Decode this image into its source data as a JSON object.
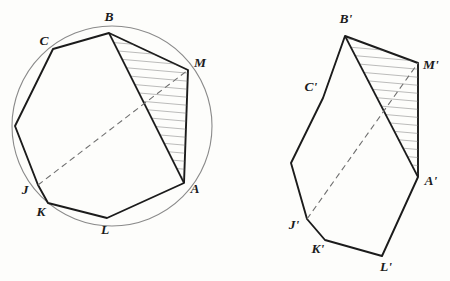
{
  "figure": {
    "kind": "geometry-diagram",
    "background_color": "#fdfdfb",
    "stroke_color": "#1b1b1b",
    "circle_color": "#8a8a8a",
    "hatch_color": "#6b6b6b",
    "dash_color": "#6f6f6f"
  },
  "left_figure": {
    "name": "cyclic-polygon",
    "circle": {
      "cx": 112,
      "cy": 126,
      "r": 100
    },
    "vertices": [
      {
        "id": "B",
        "label": "B",
        "x": 109,
        "y": 33,
        "lx": 109,
        "ly": 18,
        "labeled": true
      },
      {
        "id": "M",
        "label": "M",
        "x": 188,
        "y": 70,
        "lx": 200,
        "ly": 64,
        "labeled": true
      },
      {
        "id": "A",
        "label": "A",
        "x": 184,
        "y": 183,
        "lx": 195,
        "ly": 190,
        "labeled": true
      },
      {
        "id": "L",
        "label": "L",
        "x": 107,
        "y": 218,
        "lx": 105,
        "ly": 231,
        "labeled": true
      },
      {
        "id": "K",
        "label": "K",
        "x": 48,
        "y": 203,
        "lx": 41,
        "ly": 213,
        "labeled": true
      },
      {
        "id": "J",
        "label": "J",
        "x": 38,
        "y": 185,
        "lx": 25,
        "ly": 191,
        "labeled": true
      },
      {
        "id": "V7",
        "label": "",
        "x": 15,
        "y": 126,
        "lx": 0,
        "ly": 0,
        "labeled": false
      },
      {
        "id": "C",
        "label": "C",
        "x": 53,
        "y": 49,
        "lx": 44,
        "ly": 42,
        "labeled": true
      }
    ],
    "hatched_triangle": [
      "B",
      "M",
      "A"
    ],
    "dashed_diagonal": [
      "J",
      "M"
    ],
    "chord": [
      "B",
      "A"
    ]
  },
  "right_figure": {
    "name": "noncyclic-polygon",
    "vertices": [
      {
        "id": "B2",
        "label": "B'",
        "x": 345,
        "y": 36,
        "lx": 346,
        "ly": 20,
        "labeled": true
      },
      {
        "id": "M2",
        "label": "M'",
        "x": 418,
        "y": 63,
        "lx": 431,
        "ly": 66,
        "labeled": true
      },
      {
        "id": "A2",
        "label": "A'",
        "x": 418,
        "y": 177,
        "lx": 431,
        "ly": 182,
        "labeled": true
      },
      {
        "id": "L2",
        "label": "L'",
        "x": 382,
        "y": 256,
        "lx": 386,
        "ly": 268,
        "labeled": true
      },
      {
        "id": "K2",
        "label": "K'",
        "x": 325,
        "y": 240,
        "lx": 318,
        "ly": 250,
        "labeled": true
      },
      {
        "id": "J2",
        "label": "J'",
        "x": 307,
        "y": 219,
        "lx": 294,
        "ly": 226,
        "labeled": true
      },
      {
        "id": "V72",
        "label": "",
        "x": 291,
        "y": 163,
        "lx": 0,
        "ly": 0,
        "labeled": false
      },
      {
        "id": "C2",
        "label": "C'",
        "x": 323,
        "y": 98,
        "lx": 311,
        "ly": 88,
        "labeled": true
      }
    ],
    "hatched_triangle": [
      "B2",
      "M2",
      "A2"
    ],
    "dashed_diagonal": [
      "J2",
      "M2"
    ],
    "chord": [
      "B2",
      "A2"
    ]
  },
  "chart_data": {
    "type": "diagram",
    "title": "",
    "annotations": [
      "B",
      "M",
      "A",
      "L",
      "K",
      "J",
      "C",
      "B'",
      "M'",
      "A'",
      "L'",
      "K'",
      "J'",
      "C'"
    ]
  }
}
